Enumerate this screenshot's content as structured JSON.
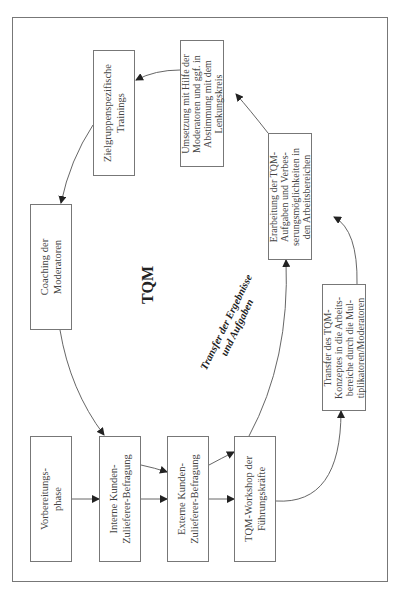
{
  "diagram": {
    "title": "TQM",
    "orientation": "rotated-90-ccw",
    "colors": {
      "line": "#777777",
      "text": "#444444",
      "arrow": "#222222"
    },
    "boxes": [
      {
        "id": "vorbereitung",
        "label": "Vorbereitungs-\nphase"
      },
      {
        "id": "interne",
        "label": "Interne Kunden-\nZulieferer-Befragung"
      },
      {
        "id": "externe",
        "label": "Externe Kunden-\nZulieferer-Befragung"
      },
      {
        "id": "workshop",
        "label": "TQM-Workshop der\nFührungskräfte"
      },
      {
        "id": "transfer",
        "label": "Transfer des TQM-\nKonzeptes in die Arbeits-\nbereiche durch die Mul-\ntiplikatoren/Moderatoren"
      },
      {
        "id": "erarbeitung",
        "label": "Erarbeitung der TQM-\nAufgaben und Verbes-\nserungsmöglichkeiten in\nden Arbeitsbereichen"
      },
      {
        "id": "umsetzung",
        "label": "Umsetzung mit Hilfe der\nModeratoren und ggf. in\nAbstimmung mit dem\nLenkungskreis"
      },
      {
        "id": "training",
        "label": "Zielgruppenspezifische\nTrainings"
      },
      {
        "id": "coaching",
        "label": "Coaching der\nModeratoren"
      }
    ],
    "edge_label": "Transfer der Ergebnisse\nund Aufgaben",
    "edges": [
      {
        "from": "vorbereitung",
        "to": "interne"
      },
      {
        "from": "interne",
        "to": "externe"
      },
      {
        "from": "interne",
        "to": "externe"
      },
      {
        "from": "externe",
        "to": "workshop"
      },
      {
        "from": "externe",
        "to": "workshop"
      },
      {
        "from": "workshop",
        "to": "transfer"
      },
      {
        "from": "workshop",
        "to": "erarbeitung",
        "label": "Transfer der Ergebnisse und Aufgaben"
      },
      {
        "from": "transfer",
        "to": "erarbeitung"
      },
      {
        "from": "erarbeitung",
        "to": "umsetzung"
      },
      {
        "from": "umsetzung",
        "to": "training"
      },
      {
        "from": "training",
        "to": "coaching"
      },
      {
        "from": "coaching",
        "to": "interne"
      }
    ]
  }
}
